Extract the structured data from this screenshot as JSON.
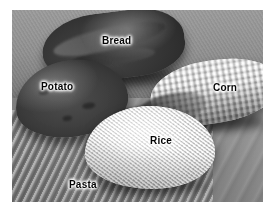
{
  "figure": {
    "kind": "photograph",
    "color_mode": "grayscale",
    "background_color": "#ffffff",
    "label_color": "#0a0a0a",
    "label_halo_color": "#ffffff"
  },
  "labels": {
    "bread": "Bread",
    "potato": "Potato",
    "corn": "Corn",
    "rice": "Rice",
    "pasta": "Pasta"
  }
}
